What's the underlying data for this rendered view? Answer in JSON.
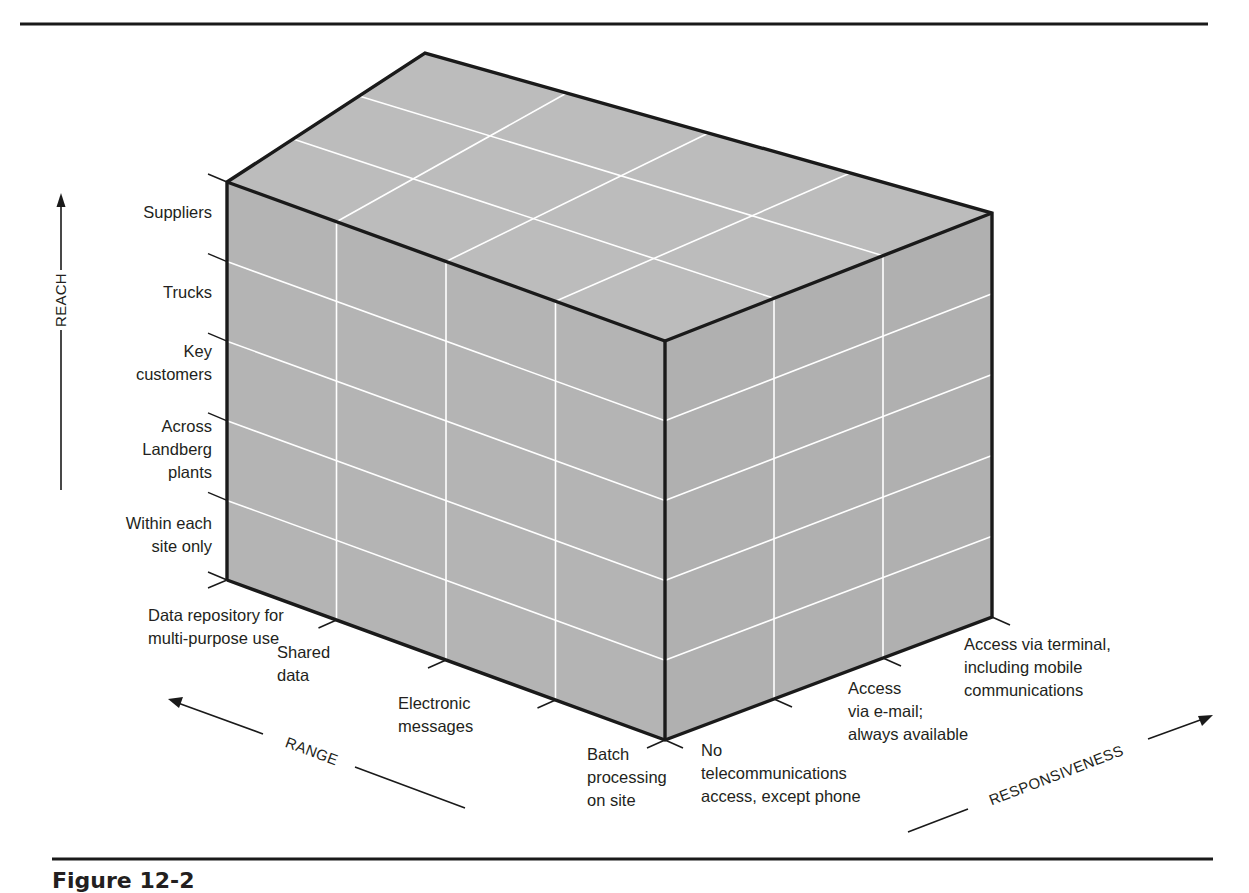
{
  "figure": {
    "caption": "Figure 12-2",
    "face_color": "#b4b4b4",
    "top_face_color": "#bcbcbc",
    "grid_color": "#ffffff",
    "edge_color": "#1a1a1a"
  },
  "axes": {
    "reach": {
      "title": "REACH",
      "direction": "up",
      "levels": [
        "Within each site only",
        "Across Landberg plants",
        "Key customers",
        "Trucks",
        "Suppliers"
      ],
      "label_lines": [
        [
          "Within each",
          "site only"
        ],
        [
          "Across",
          "Landberg",
          "plants"
        ],
        [
          "Key",
          "customers"
        ],
        [
          "Trucks"
        ],
        [
          "Suppliers"
        ]
      ]
    },
    "range": {
      "title": "RANGE",
      "direction": "back-left",
      "levels": [
        "Batch processing on site",
        "Electronic messages",
        "Shared data",
        "Data repository for multi-purpose use"
      ],
      "label_lines": [
        [
          "Batch",
          "processing",
          "on site"
        ],
        [
          "Electronic",
          "messages"
        ],
        [
          "Shared",
          "data"
        ],
        [
          "Data repository for",
          "multi-purpose use"
        ]
      ]
    },
    "responsiveness": {
      "title": "RESPONSIVENESS",
      "direction": "back-right",
      "levels": [
        "No telecommunications access, except phone",
        "Access via e-mail; always available",
        "Access via terminal, including mobile communications"
      ],
      "label_lines": [
        [
          "No",
          "telecommunications",
          "access, except phone"
        ],
        [
          "Access",
          "via e-mail;",
          "always available"
        ],
        [
          "Access via terminal,",
          "including mobile",
          "communications"
        ]
      ]
    }
  }
}
